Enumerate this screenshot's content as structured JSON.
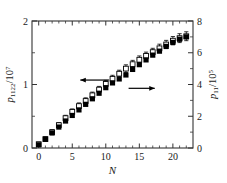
{
  "chart_data": {
    "type": "scatter",
    "title": "",
    "xlabel": "N",
    "ylabel_left": "p1122/10^7",
    "ylabel_right": "p11/10^5",
    "xlim": [
      -1,
      23
    ],
    "ylim_left": [
      0,
      2
    ],
    "ylim_right": [
      0,
      8
    ],
    "xticks": [
      0,
      5,
      10,
      15,
      20
    ],
    "xticklabels": [
      "0",
      "5",
      "10",
      "15",
      "20"
    ],
    "yticks_left": [
      0,
      1,
      2
    ],
    "yticklabels_left": [
      "0",
      "1",
      "2"
    ],
    "yticks_right": [
      0,
      2,
      4,
      6,
      8
    ],
    "yticklabels_right": [
      "0",
      "2",
      "4",
      "6",
      "8"
    ],
    "minor_ticks_left": [
      0.5,
      1.5
    ],
    "minor_ticks_right": [
      1,
      3,
      5,
      7
    ],
    "minor_ticks_x": [
      1,
      2,
      3,
      4,
      6,
      7,
      8,
      9,
      11,
      12,
      13,
      14,
      16,
      17,
      18,
      19,
      21,
      22
    ],
    "grid": false,
    "legend_position": "none",
    "annotations": [
      {
        "name": "left-arrow",
        "text": "",
        "direction": "left",
        "x_start": 10.5,
        "x_end": 6.2,
        "y_left": 1.07
      },
      {
        "name": "right-arrow",
        "text": "",
        "direction": "right",
        "x_start": 13.4,
        "x_end": 17.3,
        "y_left": 0.94
      }
    ],
    "series": [
      {
        "name": "p1122 (open squares, left axis)",
        "axis": "left",
        "marker": "open-square",
        "color": "#000000",
        "x": [
          0,
          1,
          2,
          3,
          4,
          5,
          6,
          7,
          8,
          9,
          10,
          11,
          12,
          13,
          14,
          15,
          16,
          17,
          18,
          19,
          20,
          21,
          22
        ],
        "values": [
          0.06,
          0.14,
          0.25,
          0.36,
          0.47,
          0.57,
          0.66,
          0.74,
          0.83,
          0.92,
          1.01,
          1.09,
          1.17,
          1.25,
          1.32,
          1.39,
          1.45,
          1.51,
          1.57,
          1.63,
          1.69,
          1.73,
          1.76
        ],
        "yerr": [
          0.03,
          0.035,
          0.04,
          0.04,
          0.045,
          0.045,
          0.05,
          0.05,
          0.05,
          0.05,
          0.055,
          0.055,
          0.055,
          0.06,
          0.06,
          0.06,
          0.06,
          0.06,
          0.065,
          0.065,
          0.065,
          0.07,
          0.07
        ]
      },
      {
        "name": "p11 (filled squares, right axis)",
        "axis": "right",
        "marker": "filled-square",
        "color": "#000000",
        "x": [
          0,
          1,
          2,
          3,
          4,
          5,
          6,
          7,
          8,
          9,
          10,
          11,
          12,
          13,
          14,
          15,
          16,
          17,
          18,
          19,
          20,
          21,
          22
        ],
        "values": [
          0.2,
          0.55,
          0.95,
          1.32,
          1.7,
          2.05,
          2.4,
          2.75,
          3.1,
          3.45,
          3.8,
          4.1,
          4.35,
          4.6,
          4.95,
          5.25,
          5.55,
          5.85,
          6.1,
          6.4,
          6.65,
          6.85,
          7.0
        ],
        "yerr": [
          0,
          0,
          0,
          0,
          0,
          0,
          0,
          0,
          0,
          0,
          0,
          0,
          0,
          0,
          0,
          0,
          0,
          0,
          0,
          0,
          0,
          0,
          0
        ]
      }
    ]
  }
}
